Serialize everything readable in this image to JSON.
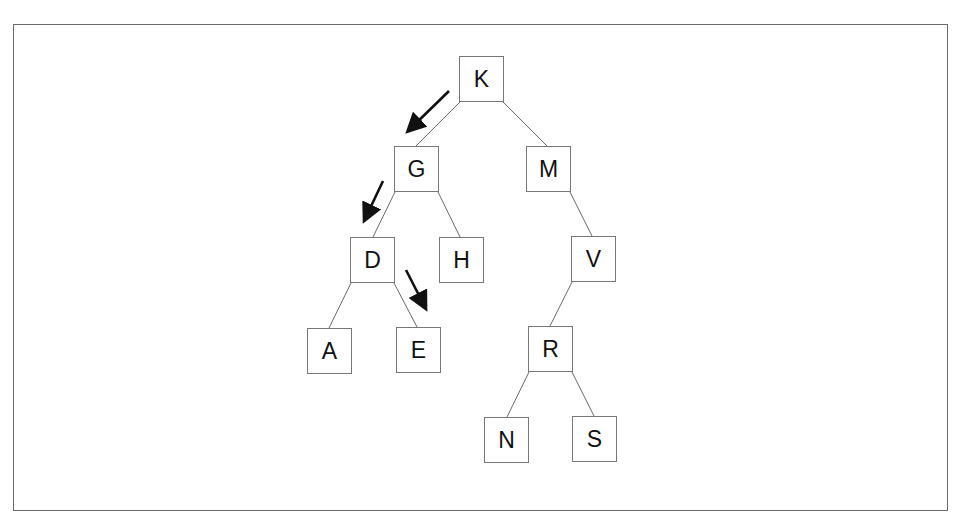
{
  "diagram": {
    "type": "binary-search-tree",
    "nodes": [
      {
        "id": "K",
        "label": "K",
        "x": 459,
        "y": 56
      },
      {
        "id": "G",
        "label": "G",
        "x": 394,
        "y": 146
      },
      {
        "id": "M",
        "label": "M",
        "x": 526,
        "y": 146
      },
      {
        "id": "D",
        "label": "D",
        "x": 350,
        "y": 237
      },
      {
        "id": "H",
        "label": "H",
        "x": 439,
        "y": 237
      },
      {
        "id": "V",
        "label": "V",
        "x": 571,
        "y": 236
      },
      {
        "id": "A",
        "label": "A",
        "x": 307,
        "y": 328
      },
      {
        "id": "E",
        "label": "E",
        "x": 396,
        "y": 327
      },
      {
        "id": "R",
        "label": "R",
        "x": 528,
        "y": 326
      },
      {
        "id": "N",
        "label": "N",
        "x": 484,
        "y": 417
      },
      {
        "id": "S",
        "label": "S",
        "x": 572,
        "y": 416
      }
    ],
    "edges": [
      [
        "K",
        "G"
      ],
      [
        "K",
        "M"
      ],
      [
        "G",
        "D"
      ],
      [
        "G",
        "H"
      ],
      [
        "M",
        "V"
      ],
      [
        "D",
        "A"
      ],
      [
        "D",
        "E"
      ],
      [
        "V",
        "R"
      ],
      [
        "R",
        "N"
      ],
      [
        "R",
        "S"
      ]
    ],
    "search_path_arrows": [
      {
        "from": "K",
        "to": "G"
      },
      {
        "from": "G",
        "to": "D"
      },
      {
        "from": "D",
        "to": "E"
      }
    ],
    "colors": {
      "node_border": "#777777",
      "edge": "#6a6a6a",
      "arrow": "#111111",
      "frame": "#6a6a6a"
    }
  }
}
